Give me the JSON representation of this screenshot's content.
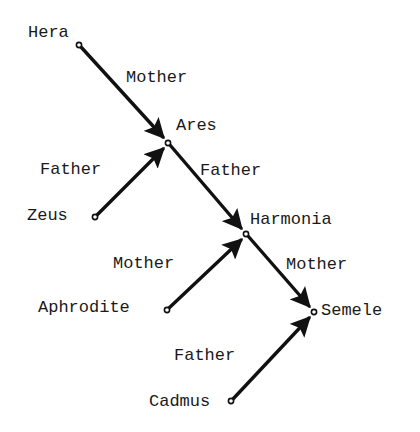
{
  "diagram": {
    "nodes": [
      {
        "id": "hera",
        "label": "Hera"
      },
      {
        "id": "ares",
        "label": "Ares"
      },
      {
        "id": "zeus",
        "label": "Zeus"
      },
      {
        "id": "harmonia",
        "label": "Harmonia"
      },
      {
        "id": "aphrodite",
        "label": "Aphrodite"
      },
      {
        "id": "semele",
        "label": "Semele"
      },
      {
        "id": "cadmus",
        "label": "Cadmus"
      }
    ],
    "edges": [
      {
        "from": "hera",
        "to": "ares",
        "label": "Mother"
      },
      {
        "from": "zeus",
        "to": "ares",
        "label": "Father"
      },
      {
        "from": "ares",
        "to": "harmonia",
        "label": "Father"
      },
      {
        "from": "aphrodite",
        "to": "harmonia",
        "label": "Mother"
      },
      {
        "from": "harmonia",
        "to": "semele",
        "label": "Mother"
      },
      {
        "from": "cadmus",
        "to": "semele",
        "label": "Father"
      }
    ]
  }
}
